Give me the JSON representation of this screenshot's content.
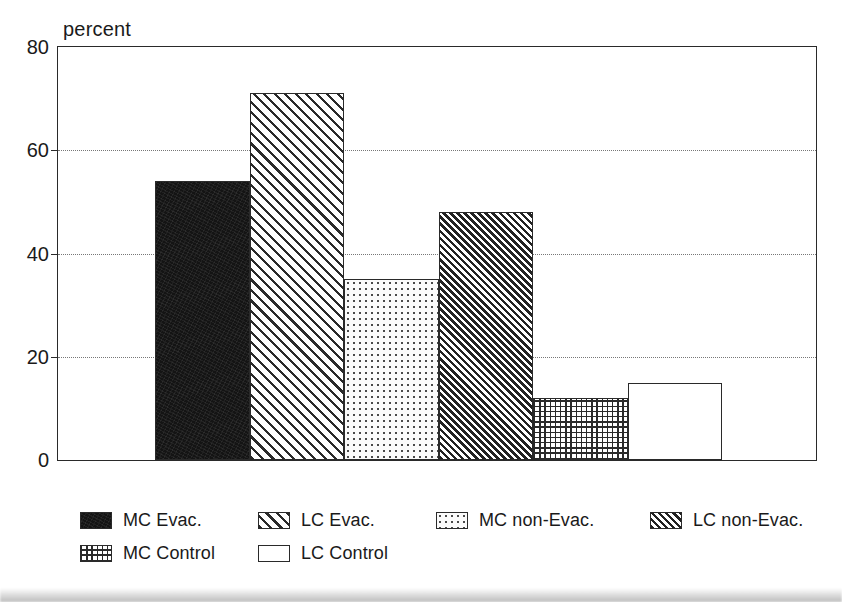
{
  "chart_data": {
    "type": "bar",
    "title": "",
    "subtitle": "",
    "xlabel": "",
    "ylabel": "percent",
    "ylim": [
      0,
      80
    ],
    "yticks": [
      0,
      20,
      40,
      60,
      80
    ],
    "ytick_labels": [
      "0",
      "20",
      "40",
      "60",
      "80"
    ],
    "gridlines_at": [
      20,
      40,
      60
    ],
    "grid": "horizontal-dotted",
    "legend_position": "below-plot",
    "categories": [
      "MC Evac.",
      "LC Evac.",
      "MC non-Evac.",
      "LC non-Evac.",
      "MC Control",
      "LC Control"
    ],
    "values": [
      54,
      71,
      35,
      48,
      12,
      15
    ],
    "bar_patterns": [
      "solid-black",
      "wide-diagonal-hatch",
      "sparse-dots",
      "dense-diagonal-hatch",
      "grid-dots",
      "empty-white"
    ]
  },
  "axis": {
    "unit_label": "percent",
    "ticks": [
      {
        "value": 80,
        "label": "80"
      },
      {
        "value": 60,
        "label": "60"
      },
      {
        "value": 40,
        "label": "40"
      },
      {
        "value": 20,
        "label": "20"
      },
      {
        "value": 0,
        "label": "0"
      }
    ]
  },
  "legend": {
    "rows": [
      {
        "entries": [
          {
            "label": "MC Evac.",
            "pattern": "solid-black",
            "offset": 0
          },
          {
            "label": "LC Evac.",
            "pattern": "wide-diagonal-hatch",
            "offset": 178
          },
          {
            "label": "MC non-Evac.",
            "pattern": "sparse-dots",
            "offset": 356
          },
          {
            "label": "LC non-Evac.",
            "pattern": "dense-diagonal-hatch",
            "offset": 570
          }
        ]
      },
      {
        "entries": [
          {
            "label": "MC Control",
            "pattern": "grid-dots",
            "offset": 0
          },
          {
            "label": "LC Control",
            "pattern": "empty-white",
            "offset": 178
          }
        ]
      }
    ]
  },
  "style": {
    "axis_color": "#2a2a2a",
    "grid_color": "#777777",
    "text_color": "#1a1a1a",
    "background": "#ffffff"
  }
}
